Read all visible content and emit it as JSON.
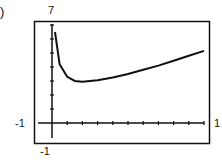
{
  "panel_label": ")",
  "chart_data": {
    "type": "line",
    "title": "",
    "xlabel": "",
    "ylabel": "",
    "xlim": [
      -1,
      1
    ],
    "ylim": [
      -1,
      7
    ],
    "tick_labels": {
      "ymax": "7",
      "ymin": "-1",
      "xmin": "-1",
      "xmax": "1"
    },
    "grid": false,
    "x": [
      0.02,
      0.05,
      0.1,
      0.15,
      0.2,
      0.3,
      0.4,
      0.5,
      0.6,
      0.7,
      0.8,
      0.9,
      1.0
    ],
    "series": [
      {
        "name": "f(x)",
        "values": [
          6.5,
          4.2,
          3.3,
          3.0,
          2.95,
          3.05,
          3.25,
          3.5,
          3.8,
          4.1,
          4.45,
          4.8,
          5.15
        ]
      }
    ]
  }
}
